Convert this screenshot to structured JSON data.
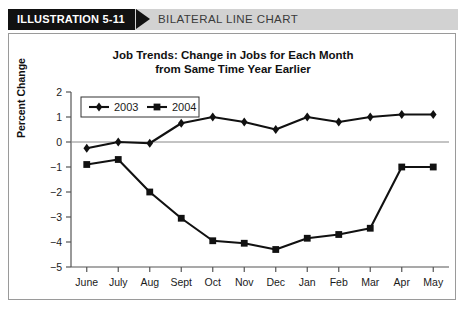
{
  "header": {
    "tag": "ILLUSTRATION 5-11",
    "title": "BILATERAL LINE CHART",
    "tag_bg": "#111111",
    "band_bg": "#d2d2d2"
  },
  "chart_data": {
    "type": "line",
    "title": "Job Trends: Change in Jobs for Each Month from Same Time Year Earlier",
    "title_line1": "Job Trends: Change in Jobs for Each Month",
    "title_line2": "from Same Time Year Earlier",
    "xlabel": "",
    "ylabel": "Percent Change",
    "categories": [
      "June",
      "July",
      "Aug",
      "Sept",
      "Oct",
      "Nov",
      "Dec",
      "Jan",
      "Feb",
      "Mar",
      "Apr",
      "May"
    ],
    "ylim": [
      -5,
      2
    ],
    "yticks": [
      2,
      1,
      0,
      -1,
      -2,
      -3,
      -4,
      -5
    ],
    "ytick_labels": [
      "2",
      "1",
      "0",
      "−1",
      "−2",
      "−3",
      "−4",
      "−5"
    ],
    "grid": false,
    "zero_line": true,
    "legend_position": "top-left-inside",
    "series": [
      {
        "name": "2003",
        "marker": "diamond",
        "color": "#111111",
        "values": [
          -0.25,
          0.0,
          -0.05,
          0.75,
          1.0,
          0.8,
          0.5,
          1.0,
          0.8,
          1.0,
          1.1,
          1.1
        ]
      },
      {
        "name": "2004",
        "marker": "square",
        "color": "#111111",
        "values": [
          -0.9,
          -0.7,
          -2.0,
          -3.05,
          -3.95,
          -4.05,
          -4.3,
          -3.85,
          -3.7,
          -3.45,
          -1.0,
          -1.0
        ]
      }
    ]
  }
}
